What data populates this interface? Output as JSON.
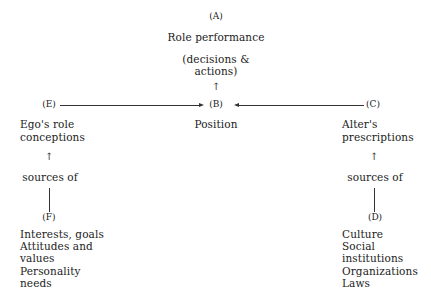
{
  "nodes": {
    "A": {
      "label": "(A)",
      "title": "Role performance",
      "subtitle": "(decisions &\nactions)"
    },
    "B": {
      "label": "(B)",
      "title": "Position"
    },
    "C": {
      "label": "(C)",
      "title": "Alter's\nprescriptions"
    },
    "D": {
      "label": "(D)",
      "items": "Culture\nSocial\ninstitutions\nOrganizations\nLaws"
    },
    "E": {
      "label": "(E)",
      "title": "Ego's role\nconceptions"
    },
    "F": {
      "label": "(F)",
      "items": "Interests, goals\nAttitudes and\nvalues\nPersonality\nneeds"
    }
  },
  "connectors": {
    "left_sources_label": "sources of",
    "right_sources_label": "sources of",
    "up_arrow": "↑"
  },
  "edges": [
    {
      "from": "E",
      "to": "B",
      "type": "arrow-right"
    },
    {
      "from": "C",
      "to": "B",
      "type": "arrow-left"
    },
    {
      "from": "B",
      "to": "A",
      "type": "arrow-up"
    },
    {
      "from": "F",
      "to": "E",
      "type": "sources-of"
    },
    {
      "from": "D",
      "to": "C",
      "type": "sources-of"
    }
  ]
}
